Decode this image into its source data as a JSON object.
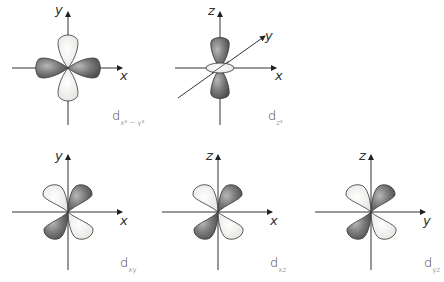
{
  "diagram": {
    "colors": {
      "positive_lobe": "#e9e9e6",
      "negative_lobe": "#6d6d6d",
      "axis": "#333333",
      "outline": "#333333"
    },
    "orbitals": [
      {
        "id": "dx2-y2",
        "label_main": "d",
        "label_sub": "x² − y²",
        "axes": [
          "y",
          "x"
        ]
      },
      {
        "id": "dz2",
        "label_main": "d",
        "label_sub": "z²",
        "axes": [
          "z",
          "y",
          "x"
        ]
      },
      {
        "id": "dxy",
        "label_main": "d",
        "label_sub": "xy",
        "axes": [
          "y",
          "x"
        ]
      },
      {
        "id": "dxz",
        "label_main": "d",
        "label_sub": "xz",
        "axes": [
          "z",
          "x"
        ]
      },
      {
        "id": "dyz",
        "label_main": "d",
        "label_sub": "yz",
        "axes": [
          "z",
          "y"
        ]
      }
    ]
  }
}
